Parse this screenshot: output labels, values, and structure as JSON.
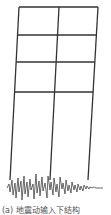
{
  "figure": {
    "type": "frame-under-ground-motion",
    "stories": 4,
    "bays": 2,
    "caption": "(a) 地震动输入下结构"
  },
  "colors": {
    "frame": "#333333",
    "wave": "#444444",
    "caption": "#555555"
  }
}
